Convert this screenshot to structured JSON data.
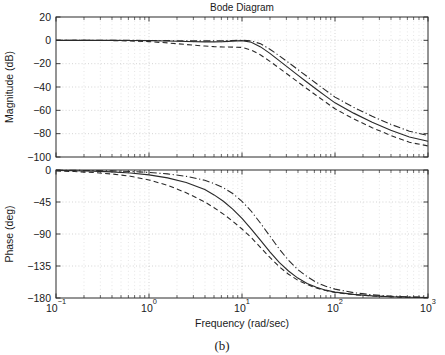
{
  "figure": {
    "title": "Bode Diagram",
    "caption": "(b)",
    "background": "#ffffff",
    "ink_color": "#2a2a2a"
  },
  "chart_data": [
    {
      "type": "line",
      "panel": "magnitude",
      "title": "Bode Diagram",
      "xlabel": "",
      "ylabel": "Magnitude (dB)",
      "xscale": "log",
      "xlim": [
        0.1,
        1000
      ],
      "ylim": [
        -100,
        20
      ],
      "yticks": [
        20,
        0,
        -20,
        -40,
        -60,
        -80,
        -100
      ],
      "ytick_labels": [
        "20",
        "0",
        "-20",
        "-40",
        "-60",
        "-80",
        "-100"
      ],
      "xticks": [
        0.1,
        1,
        10,
        100,
        1000
      ],
      "xtick_labels": [
        "10-1",
        "10 0",
        "10 1",
        "10 2",
        "10 3"
      ],
      "grid": true,
      "legend": "none",
      "series": [
        {
          "name": "nominal",
          "style": "solid",
          "x": [
            0.1,
            0.158,
            0.251,
            0.398,
            0.631,
            1.0,
            1.585,
            2.512,
            3.981,
            5.012,
            6.31,
            7.943,
            10.0,
            12.589,
            15.849,
            19.953,
            25.119,
            31.623,
            39.811,
            50.119,
            63.096,
            79.433,
            100.0,
            158.49,
            251.19,
            398.11,
            630.96,
            1000.0
          ],
          "y": [
            0.0,
            -0.01,
            -0.02,
            -0.05,
            -0.12,
            -0.3,
            -0.6,
            -1.0,
            -1.3,
            -1.3,
            -1.1,
            -0.7,
            -0.3,
            -1.6,
            -5.6,
            -11.2,
            -17.4,
            -23.6,
            -29.8,
            -35.9,
            -41.9,
            -47.8,
            -53.6,
            -62.4,
            -70.2,
            -77.0,
            -82.9,
            -86.5
          ]
        },
        {
          "name": "lower-bound",
          "style": "dashed",
          "x": [
            0.1,
            0.158,
            0.251,
            0.398,
            0.631,
            1.0,
            1.585,
            2.512,
            3.981,
            5.012,
            6.31,
            7.943,
            10.0,
            12.589,
            15.849,
            19.953,
            25.119,
            31.623,
            39.811,
            50.119,
            63.096,
            79.433,
            100.0,
            158.49,
            251.19,
            398.11,
            630.96,
            1000.0
          ],
          "y": [
            0.0,
            -0.03,
            -0.08,
            -0.2,
            -0.5,
            -1.1,
            -2.2,
            -3.6,
            -4.9,
            -5.4,
            -5.7,
            -5.8,
            -6.1,
            -8.3,
            -12.6,
            -18.0,
            -23.8,
            -29.7,
            -35.6,
            -41.5,
            -47.3,
            -53.0,
            -58.7,
            -67.3,
            -74.9,
            -81.6,
            -87.4,
            -90.5
          ]
        },
        {
          "name": "upper-bound",
          "style": "dashdot",
          "x": [
            0.1,
            0.158,
            0.251,
            0.398,
            0.631,
            1.0,
            1.585,
            2.512,
            3.981,
            5.012,
            6.31,
            7.943,
            10.0,
            12.589,
            15.849,
            19.953,
            25.119,
            31.623,
            39.811,
            50.119,
            63.096,
            79.433,
            100.0,
            158.49,
            251.19,
            398.11,
            630.96,
            1000.0
          ],
          "y": [
            0.0,
            -0.005,
            -0.01,
            -0.02,
            -0.05,
            -0.12,
            -0.25,
            -0.42,
            -0.5,
            -0.45,
            -0.3,
            -0.1,
            0.1,
            -0.5,
            -3.0,
            -7.6,
            -13.2,
            -19.0,
            -25.0,
            -31.0,
            -37.0,
            -42.9,
            -48.7,
            -57.4,
            -65.1,
            -72.0,
            -77.9,
            -81.5
          ]
        }
      ]
    },
    {
      "type": "line",
      "panel": "phase",
      "title": "",
      "xlabel": "Frequency (rad/sec)",
      "ylabel": "Phase (deg)",
      "xscale": "log",
      "xlim": [
        0.1,
        1000
      ],
      "ylim": [
        -180,
        0
      ],
      "yticks": [
        0,
        -45,
        -90,
        -135,
        -180
      ],
      "ytick_labels": [
        "0",
        "-45",
        "-90",
        "-135",
        "-180"
      ],
      "xticks": [
        0.1,
        1,
        10,
        100,
        1000
      ],
      "xtick_labels": [
        "10-1",
        "10 0",
        "10 1",
        "10 2",
        "10 3"
      ],
      "grid": true,
      "legend": "none",
      "series": [
        {
          "name": "nominal",
          "style": "solid",
          "x": [
            0.1,
            0.158,
            0.251,
            0.398,
            0.631,
            1.0,
            1.585,
            2.512,
            3.981,
            5.012,
            6.31,
            7.943,
            10.0,
            12.589,
            15.849,
            19.953,
            25.119,
            31.623,
            39.811,
            50.119,
            63.096,
            79.433,
            100.0,
            158.49,
            251.19,
            398.11,
            630.96,
            1000.0
          ],
          "y": [
            -0.6,
            -1.0,
            -1.6,
            -2.6,
            -4.2,
            -6.8,
            -11.0,
            -17.5,
            -27.5,
            -35.0,
            -44.0,
            -55.0,
            -68.0,
            -83.0,
            -99.0,
            -115.0,
            -130.0,
            -142.0,
            -152.0,
            -159.5,
            -165.0,
            -169.0,
            -171.8,
            -175.0,
            -177.0,
            -178.2,
            -178.9,
            -179.3
          ]
        },
        {
          "name": "lower-bound",
          "style": "dashed",
          "x": [
            0.1,
            0.158,
            0.251,
            0.398,
            0.631,
            1.0,
            1.585,
            2.512,
            3.981,
            5.012,
            6.31,
            7.943,
            10.0,
            12.589,
            15.849,
            19.953,
            25.119,
            31.623,
            39.811,
            50.119,
            63.096,
            79.433,
            100.0,
            158.49,
            251.19,
            398.11,
            630.96,
            1000.0
          ],
          "y": [
            -1.4,
            -2.2,
            -3.5,
            -5.6,
            -8.8,
            -14.0,
            -21.5,
            -32.0,
            -45.0,
            -53.0,
            -62.0,
            -72.0,
            -83.0,
            -95.0,
            -109.0,
            -123.0,
            -136.0,
            -146.5,
            -155.0,
            -161.0,
            -166.0,
            -169.5,
            -172.2,
            -175.3,
            -177.2,
            -178.3,
            -179.0,
            -179.4
          ]
        },
        {
          "name": "upper-bound",
          "style": "dashdot",
          "x": [
            0.1,
            0.158,
            0.251,
            0.398,
            0.631,
            1.0,
            1.585,
            2.512,
            3.981,
            5.012,
            6.31,
            7.943,
            10.0,
            12.589,
            15.849,
            19.953,
            25.119,
            31.623,
            39.811,
            50.119,
            63.096,
            79.433,
            100.0,
            158.49,
            251.19,
            398.11,
            630.96,
            1000.0
          ],
          "y": [
            -0.3,
            -0.5,
            -0.8,
            -1.3,
            -2.1,
            -3.4,
            -5.5,
            -8.9,
            -14.5,
            -19.0,
            -25.0,
            -33.0,
            -44.0,
            -58.0,
            -75.0,
            -93.0,
            -111.0,
            -127.0,
            -140.0,
            -150.0,
            -158.0,
            -163.5,
            -167.5,
            -172.5,
            -175.5,
            -177.3,
            -178.4,
            -179.0
          ]
        }
      ]
    }
  ]
}
